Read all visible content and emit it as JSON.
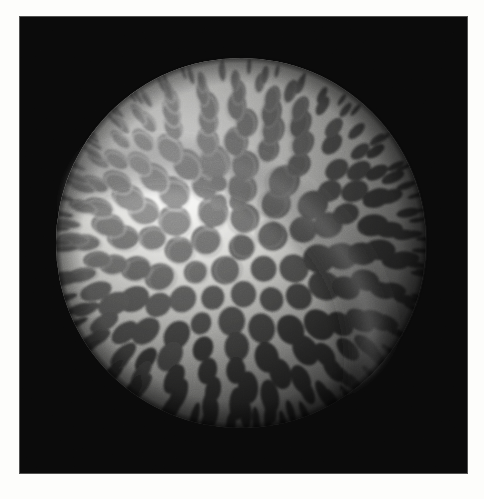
{
  "image": {
    "kind": "photograph",
    "subject": "golf-ball",
    "description": "Black and white close-up photograph of a dimpled golf ball lit from the upper left against a black background",
    "canvas_width": 484,
    "canvas_height": 499,
    "paper_color": "#fdfdfb"
  },
  "photo": {
    "x": 19,
    "y": 16,
    "width": 449,
    "height": 458,
    "background_color": "#0a0a0a",
    "background_noise_opacity": 0.35,
    "border_color": "#d8d8d4"
  },
  "ball": {
    "center_x": 241,
    "center_y": 243,
    "radius": 185,
    "base_color": "#8f8f8f",
    "terminator_color": "#111111",
    "highlight_color": "#f4f4f2",
    "land_color": "#e9e9e6",
    "rimlight_color": "#6a6a6a"
  },
  "lighting": {
    "source": "upper-left",
    "light_x": 150,
    "light_y": 140,
    "falloff_radius": 300,
    "shadow_side": "right-bottom",
    "ambient": 0.06
  },
  "dimples": {
    "count_rings": 13,
    "min_radius": 5,
    "max_radius": 17,
    "depth_contrast": 0.42,
    "pole_cluster": {
      "center_x": 228,
      "center_y": 193,
      "count": 4,
      "radius": 9,
      "tone": "dark"
    },
    "rings": [
      {
        "ring": 0,
        "count": 1,
        "polar": 0.0,
        "size": 11
      },
      {
        "ring": 1,
        "count": 6,
        "polar": 0.1,
        "size": 13
      },
      {
        "ring": 2,
        "count": 11,
        "polar": 0.19,
        "size": 14
      },
      {
        "ring": 3,
        "count": 15,
        "polar": 0.28,
        "size": 15
      },
      {
        "ring": 4,
        "count": 19,
        "polar": 0.37,
        "size": 15
      },
      {
        "ring": 5,
        "count": 23,
        "polar": 0.45,
        "size": 15
      },
      {
        "ring": 6,
        "count": 26,
        "polar": 0.53,
        "size": 14
      },
      {
        "ring": 7,
        "count": 29,
        "polar": 0.61,
        "size": 14
      },
      {
        "ring": 8,
        "count": 31,
        "polar": 0.68,
        "size": 13
      },
      {
        "ring": 9,
        "count": 33,
        "polar": 0.75,
        "size": 12
      },
      {
        "ring": 10,
        "count": 35,
        "polar": 0.82,
        "size": 11
      },
      {
        "ring": 11,
        "count": 36,
        "polar": 0.885,
        "size": 9
      },
      {
        "ring": 12,
        "count": 38,
        "polar": 0.94,
        "size": 7
      }
    ]
  },
  "texture": {
    "grain_opacity": 0.22,
    "halftone": true
  }
}
